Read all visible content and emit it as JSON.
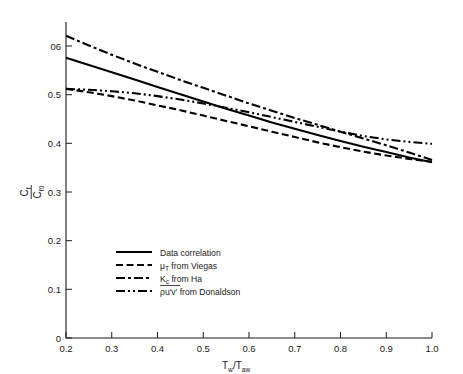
{
  "chart_data": {
    "type": "line",
    "title": "",
    "subtitle": "",
    "xlabel": "T_w/T_aw",
    "xlabel_parts": {
      "base1": "T",
      "sub1": "w",
      "slash": "/",
      "base2": "T",
      "sub2": "aw"
    },
    "ylabel": "C_f/C_f0",
    "ylabel_parts": {
      "num_base": "C",
      "num_sub": "f",
      "den_base": "C",
      "den_sub": "f",
      "den_sub2": "0"
    },
    "xlim": [
      0.2,
      1.0
    ],
    "ylim": [
      0.0,
      0.6
    ],
    "grid": false,
    "legend_position": "center",
    "xticks": [
      "0.2",
      "0.3",
      "0.4",
      "0.5",
      "0.6",
      "0.7",
      "0.8",
      "0.9",
      "1.0"
    ],
    "xtick_values": [
      0.2,
      0.3,
      0.4,
      0.5,
      0.6,
      0.7,
      0.8,
      0.9,
      1.0
    ],
    "yticks": [
      "0",
      "0.1",
      "0.2",
      "0.3",
      "0.4",
      "0.5",
      "06"
    ],
    "ytick_values": [
      0.0,
      0.1,
      0.2,
      0.3,
      0.4,
      0.5,
      0.6
    ],
    "series": [
      {
        "name": "Data correlation",
        "style": "solid",
        "x": [
          0.2,
          0.25,
          0.3,
          0.35,
          0.4,
          0.45,
          0.5,
          0.55,
          0.6,
          0.65,
          0.7,
          0.75,
          0.8,
          0.85,
          0.9,
          0.95,
          1.0
        ],
        "values": [
          0.576,
          0.561,
          0.546,
          0.531,
          0.516,
          0.501,
          0.486,
          0.471,
          0.457,
          0.443,
          0.43,
          0.417,
          0.405,
          0.393,
          0.382,
          0.371,
          0.361
        ]
      },
      {
        "name": "mu_T from Viegas",
        "label_base": "μ",
        "label_sub": "T",
        "label_rest": " from Viegas",
        "style": "dashed",
        "x": [
          0.2,
          0.25,
          0.3,
          0.35,
          0.4,
          0.45,
          0.5,
          0.55,
          0.6,
          0.65,
          0.7,
          0.75,
          0.8,
          0.85,
          0.9,
          0.95,
          1.0
        ],
        "values": [
          0.512,
          0.505,
          0.497,
          0.488,
          0.478,
          0.468,
          0.457,
          0.446,
          0.435,
          0.424,
          0.413,
          0.402,
          0.392,
          0.383,
          0.375,
          0.368,
          0.362
        ]
      },
      {
        "name": "K_c from Ha",
        "label_base": "K",
        "label_sub": "c",
        "label_rest": " from Ha",
        "style": "dashdot",
        "x": [
          0.2,
          0.25,
          0.3,
          0.35,
          0.4,
          0.45,
          0.5,
          0.55,
          0.6,
          0.65,
          0.7,
          0.75,
          0.8,
          0.85,
          0.9,
          0.95,
          1.0
        ],
        "values": [
          0.621,
          0.601,
          0.582,
          0.564,
          0.547,
          0.53,
          0.514,
          0.498,
          0.482,
          0.467,
          0.452,
          0.438,
          0.424,
          0.41,
          0.396,
          0.381,
          0.366
        ]
      },
      {
        "name": "rho u'v' from Donaldson",
        "label_base": "ρu'v'",
        "label_rest": " from Donaldson",
        "style": "dashdotdot",
        "overbar": true,
        "x": [
          0.2,
          0.25,
          0.3,
          0.35,
          0.4,
          0.45,
          0.5,
          0.55,
          0.6,
          0.65,
          0.7,
          0.75,
          0.8,
          0.85,
          0.9,
          0.95,
          1.0
        ],
        "values": [
          0.512,
          0.51,
          0.507,
          0.503,
          0.497,
          0.49,
          0.482,
          0.473,
          0.464,
          0.454,
          0.444,
          0.434,
          0.424,
          0.415,
          0.408,
          0.403,
          0.399
        ]
      }
    ],
    "legend_entries": [
      {
        "label": "Data correlation",
        "style": "solid"
      },
      {
        "label": "μT from Viegas",
        "style": "dashed"
      },
      {
        "label": "Kc from Ha",
        "style": "dashdot"
      },
      {
        "label": "ρu'v' from Donaldson",
        "style": "dashdotdot"
      }
    ],
    "colors": {
      "line": "#000000",
      "axis": "#1a1a1a",
      "background": "#ffffff"
    }
  }
}
